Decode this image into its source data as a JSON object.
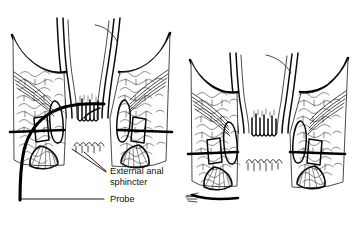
{
  "figure": {
    "background_color": "#ffffff",
    "ink_color": "#000000",
    "panels": [
      {
        "id": "left-panel",
        "name": "anal-canal-with-probe",
        "has_probe": true,
        "labels": [
          {
            "id": "external-anal-sphincter",
            "line1": "External anal",
            "line2": "sphincter",
            "leader_count": 2
          },
          {
            "id": "probe",
            "line1": "Probe",
            "leader_count": 1
          }
        ]
      },
      {
        "id": "right-panel",
        "name": "anal-canal-plain",
        "has_probe": false,
        "labels": []
      }
    ]
  },
  "labels": {
    "sphincter_line1": "External anal",
    "sphincter_line2": "sphincter",
    "probe": "Probe"
  }
}
